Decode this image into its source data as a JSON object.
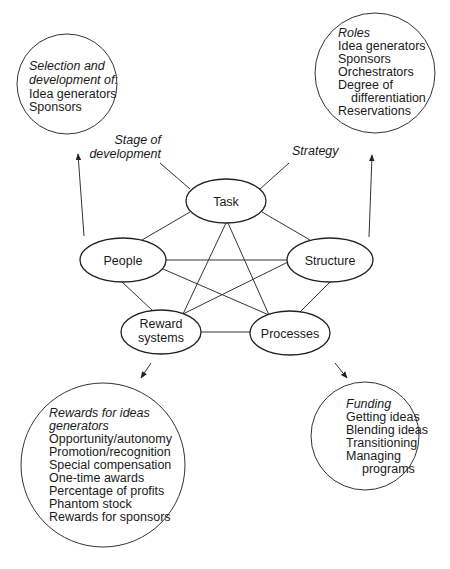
{
  "nodes": {
    "task": "Task",
    "people": "People",
    "structure": "Structure",
    "reward_systems": [
      "Reward",
      "systems"
    ],
    "processes": "Processes"
  },
  "inputs": {
    "stage_of_development": [
      "Stage of",
      "development"
    ],
    "strategy": "Strategy"
  },
  "boxes": {
    "people_box": {
      "heading": [
        "Selection and",
        "development of:"
      ],
      "items": [
        "Idea generators",
        "Sponsors"
      ]
    },
    "structure_box": {
      "heading": "Roles",
      "items": [
        "Idea generators",
        "Sponsors",
        "Orchestrators",
        "Degree of",
        "differentiation",
        "Reservations"
      ]
    },
    "reward_box": {
      "heading": [
        "Rewards for ideas",
        "generators"
      ],
      "items": [
        "Opportunity/autonomy",
        "Promotion/recognition",
        "Special compensation",
        "One-time awards",
        "Percentage of profits",
        "Phantom stock",
        "Rewards for sponsors"
      ]
    },
    "processes_box": {
      "heading": "Funding",
      "items": [
        "Getting ideas",
        "Blending ideas",
        "Transitioning",
        "Managing",
        "programs"
      ]
    }
  },
  "colors": {
    "stroke": "#333333",
    "text": "#1a1a1a",
    "background": "#ffffff"
  }
}
